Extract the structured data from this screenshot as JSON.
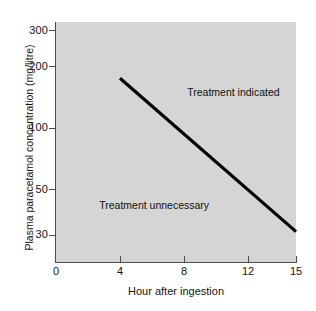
{
  "chart_data": {
    "type": "line",
    "title": "",
    "subtitle": "",
    "xlabel": "Hour after ingestion",
    "ylabel": "Plasma paracetamol concentration (mg/litre)",
    "x_ticks": [
      "0",
      "4",
      "8",
      "12",
      "15"
    ],
    "x_tick_values": [
      0,
      4,
      8,
      12,
      15
    ],
    "xlim": [
      0,
      15
    ],
    "y_ticks": [
      "300",
      "200",
      "100",
      "50",
      "30"
    ],
    "y_tick_values": [
      300,
      200,
      100,
      50,
      30
    ],
    "ylim": [
      22,
      330
    ],
    "y_scale": "log",
    "origin_label": "0",
    "grid": false,
    "legend": "none",
    "plot_background": "#d5d5d5",
    "line_color": "#000000",
    "series": [
      {
        "name": "Treatment line",
        "x": [
          4,
          15
        ],
        "values": [
          175,
          31
        ]
      }
    ],
    "annotations": [
      {
        "text": "Treatment indicated",
        "x": 8.2,
        "y": 150
      },
      {
        "text": "Treatment unnecessary",
        "x": 2.7,
        "y": 42
      }
    ]
  },
  "axes": {
    "y_title": "Plasma paracetamol concentration (mg/litre)",
    "x_title": "Hour after ingestion",
    "y_labels": [
      "300",
      "200",
      "100",
      "50",
      "30"
    ],
    "x_labels": [
      "0",
      "4",
      "8",
      "12",
      "15"
    ],
    "origin": "0"
  },
  "regions": {
    "indicated": "Treatment indicated",
    "unnecessary": "Treatment unnecessary"
  }
}
